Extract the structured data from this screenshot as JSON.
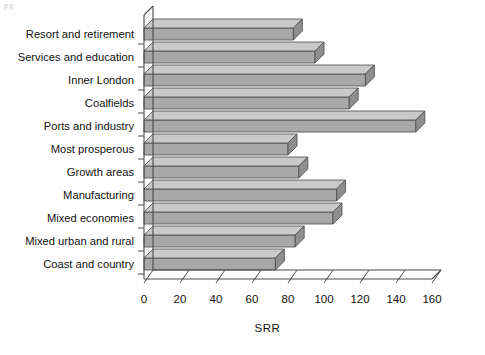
{
  "chart_data": {
    "type": "bar",
    "orientation": "horizontal",
    "title": "",
    "xlabel": "SRR",
    "ylabel": "",
    "xlim": [
      0,
      160
    ],
    "xticks": [
      0,
      20,
      40,
      60,
      80,
      100,
      120,
      140,
      160
    ],
    "grid": false,
    "legend": null,
    "style": "3d-bars",
    "categories": [
      "Resort and retirement",
      "Services and education",
      "Inner London",
      "Coalfields",
      "Ports and industry",
      "Most prosperous",
      "Growth areas",
      "Manufacturing",
      "Mixed economies",
      "Mixed urban and rural",
      "Coast and country"
    ],
    "values": [
      83,
      95,
      123,
      114,
      151,
      80,
      86,
      107,
      105,
      84,
      73
    ]
  },
  "colors": {
    "bar_front": "#a8a8a8",
    "bar_top": "#c9c9c9",
    "bar_side": "#8e8e8e",
    "axis": "#4a4a4a",
    "text": "#111111",
    "background": "#ffffff"
  },
  "artifacts": {
    "top_left": "pg",
    "mid_right": "",
    "bottom_1": "",
    "bottom_2": ""
  }
}
